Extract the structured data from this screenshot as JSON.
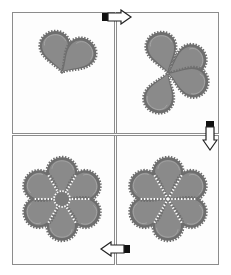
{
  "diagram": {
    "title": "",
    "colors": {
      "petal_fill": "#8a8a8a",
      "petal_gear": "#6e6e6e",
      "petal_highlight": "#a9a9a9",
      "seam_dots": "#ffffff",
      "frame_border": "#8c8c8c",
      "background": "#ffffff"
    },
    "panels": [
      {
        "id": "step-1",
        "position": "top-left",
        "petal_count": 2,
        "petal_angles": [
          -15,
          45
        ],
        "center": [
          62,
          72
        ]
      },
      {
        "id": "step-2",
        "position": "top-right",
        "petal_count": 4,
        "petal_angles": [
          -15,
          60,
          110,
          200
        ],
        "center": [
          168,
          73
        ]
      },
      {
        "id": "step-3",
        "position": "bottom-right",
        "petal_count": 6,
        "petal_angles": [
          0,
          60,
          120,
          180,
          240,
          300
        ],
        "center": [
          168,
          199
        ]
      },
      {
        "id": "step-4",
        "position": "bottom-left",
        "petal_count": 6,
        "petal_angles": [
          0,
          60,
          120,
          180,
          240,
          300
        ],
        "center": [
          62,
          199
        ],
        "has_center_disc": true
      }
    ],
    "arrows": [
      {
        "id": "arrow-1-to-2",
        "direction": "right",
        "from": "step-1",
        "to": "step-2"
      },
      {
        "id": "arrow-2-to-3",
        "direction": "down",
        "from": "step-2",
        "to": "step-3"
      },
      {
        "id": "arrow-3-to-4",
        "direction": "left",
        "from": "step-3",
        "to": "step-4"
      }
    ]
  }
}
